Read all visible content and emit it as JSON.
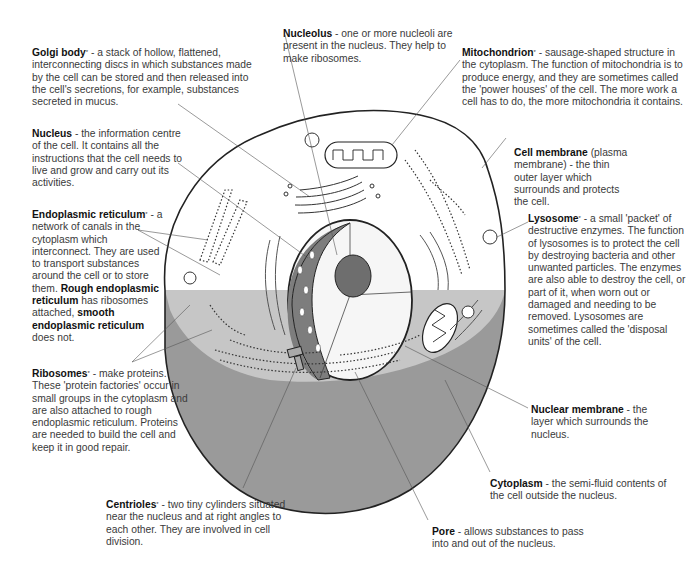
{
  "diagram": {
    "colors": {
      "outline": "#222222",
      "cut_section": "#9a9a9a",
      "cut_band": "#c4c4c4",
      "nucleus_dark": "#7d7d7d",
      "label_line": "#555555"
    },
    "labels": [
      {
        "id": "golgi",
        "term": "Golgi body",
        "starred": true,
        "text": " - a stack of hollow, flattened, interconnecting discs in which substances made by the cell can be stored and then released into the cell's secretions, for example, substances secreted in mucus."
      },
      {
        "id": "nucleolus",
        "term": "Nucleolus",
        "starred": false,
        "text": " - one or more nucleoli are present in the nucleus. They help to make ribosomes."
      },
      {
        "id": "mitochondrion",
        "term": "Mitochondrion",
        "starred": true,
        "text": " - sausage-shaped structure in the cytoplasm. The function of mitochondria is to produce energy, and they are sometimes called the 'power houses' of the cell. The more work a cell has to do, the more mitochondria it contains."
      },
      {
        "id": "nucleus",
        "term": "Nucleus",
        "starred": false,
        "text": " - the information centre of the cell. It contains all the instructions that the cell needs to live and grow and carry out its activities."
      },
      {
        "id": "cell_membrane",
        "term": "Cell membrane",
        "starred": false,
        "text": " (plasma membrane) - the thin outer layer which surrounds and protects the cell."
      },
      {
        "id": "er",
        "term": "Endoplasmic reticulum",
        "starred": true,
        "text": " - a network of canals in the cytoplasm which interconnect. They are used to transport substances around the cell or to store them. ",
        "term2": "Rough endoplasmic reticulum",
        "text2": " has ribosomes attached, ",
        "term3": "smooth endoplasmic reticulum",
        "text3": " does not."
      },
      {
        "id": "lysosome",
        "term": "Lysosome",
        "starred": true,
        "text": " - a small 'packet' of destructive enzymes. The function of lysosomes is to protect the cell by destroying bacteria and other unwanted particles. The enzymes are also able to destroy the cell, or part of it, when worn out or damaged and needing to be removed. Lysosomes are sometimes called the 'disposal units' of the cell."
      },
      {
        "id": "ribosomes",
        "term": "Ribosomes",
        "starred": true,
        "text": " - make proteins. These 'protein factories' occur in small groups in the cytoplasm and are also attached to rough endoplasmic reticulum. Proteins are needed to build the cell and keep it in good repair."
      },
      {
        "id": "nuclear_membrane",
        "term": "Nuclear membrane",
        "starred": false,
        "text": " - the layer which surrounds the nucleus."
      },
      {
        "id": "cytoplasm",
        "term": "Cytoplasm",
        "starred": false,
        "text": " - the semi-fluid contents of the cell outside the nucleus."
      },
      {
        "id": "centrioles",
        "term": "Centrioles",
        "starred": true,
        "text": " - two tiny cylinders situated near the nucleus and at right angles to each other. They are involved in cell division."
      },
      {
        "id": "pore",
        "term": "Pore",
        "starred": false,
        "text": " - allows substances to pass into and out of the nucleus."
      }
    ],
    "star": "*"
  }
}
